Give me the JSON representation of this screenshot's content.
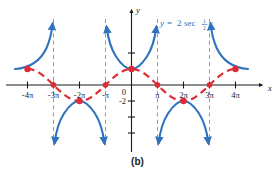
{
  "figure": {
    "caption": "(b)",
    "equation": {
      "lhs": "y",
      "eq": "=",
      "coefficient": "2",
      "func": "sec",
      "frac_num": "1",
      "frac_den": "2",
      "variable": "x",
      "full": "y = 2 sec 1/2 x",
      "color": "#2f72bd"
    },
    "axis_labels": {
      "y": "y",
      "x": "x",
      "origin": "0"
    },
    "colors": {
      "secant": "#2f72bd",
      "cosine": "#e02b32",
      "asymptote": "#9a9a9a",
      "axis": "#1a1a1a",
      "background": "#ffffff"
    }
  },
  "chart_data": {
    "type": "line",
    "xlabel": "x",
    "ylabel": "y",
    "xlim": [
      -14.5,
      14.8
    ],
    "ylim": [
      -5.6,
      5.4
    ],
    "grid": false,
    "legend": "none",
    "x_ticks": [
      {
        "value": -12.566,
        "label": "-4π"
      },
      {
        "value": -9.425,
        "label": "-3π"
      },
      {
        "value": -6.283,
        "label": "-2π"
      },
      {
        "value": -3.142,
        "label": "-π"
      },
      {
        "value": 3.142,
        "label": "π"
      },
      {
        "value": 6.283,
        "label": "2π"
      },
      {
        "value": 9.425,
        "label": "3π"
      },
      {
        "value": 12.566,
        "label": "4π"
      }
    ],
    "y_ticks": [
      {
        "value": -4,
        "label": ""
      },
      {
        "value": -2,
        "label": "-2"
      },
      {
        "value": 2,
        "label": ""
      },
      {
        "value": 4,
        "label": ""
      }
    ],
    "asymptotes": [
      -9.425,
      -3.142,
      3.142,
      9.425
    ],
    "series": [
      {
        "name": "y = 2 sec (1/2)x",
        "type": "secant",
        "style": "solid",
        "color": "#2f72bd",
        "branches": [
          {
            "domain": [
              -12.566,
              -9.425
            ],
            "direction": "up",
            "vertex": null
          },
          {
            "domain": [
              -9.425,
              -3.142
            ],
            "direction": "down",
            "vertex": [
              -6.283,
              -2
            ]
          },
          {
            "domain": [
              -3.142,
              3.142
            ],
            "direction": "up",
            "vertex": [
              0,
              2
            ]
          },
          {
            "domain": [
              3.142,
              9.425
            ],
            "direction": "down",
            "vertex": [
              6.283,
              -2
            ]
          },
          {
            "domain": [
              9.425,
              12.566
            ],
            "direction": "up",
            "vertex": null
          }
        ]
      },
      {
        "name": "y = 2 cos (1/2)x",
        "type": "cosine",
        "style": "dashed",
        "color": "#e02b32",
        "amplitude": 2,
        "period": 12.566,
        "domain": [
          -12.566,
          12.566
        ]
      }
    ],
    "points": [
      {
        "x": -12.566,
        "y": 2,
        "color": "#e02b32"
      },
      {
        "x": -9.425,
        "y": 0,
        "color": "#e02b32"
      },
      {
        "x": -6.283,
        "y": -2,
        "color": "#e02b32"
      },
      {
        "x": -3.142,
        "y": 0,
        "color": "#e02b32"
      },
      {
        "x": 0,
        "y": 2,
        "color": "#e02b32"
      },
      {
        "x": 3.142,
        "y": 0,
        "color": "#e02b32"
      },
      {
        "x": 6.283,
        "y": -2,
        "color": "#e02b32"
      },
      {
        "x": 9.425,
        "y": 0,
        "color": "#e02b32"
      },
      {
        "x": 12.566,
        "y": 2,
        "color": "#e02b32"
      }
    ]
  }
}
